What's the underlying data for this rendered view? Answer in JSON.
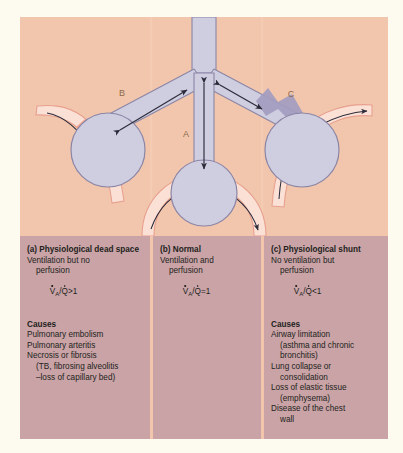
{
  "figure": {
    "kind": "medical-diagram",
    "title_visible": false,
    "colors": {
      "page": "#ffffff",
      "plate_border": "#fdfaf0",
      "plate_background": "#f2c6ac",
      "text_band": "#c9a3a6",
      "airway_fill": "#cfcde0",
      "airway_stroke": "#8b86a6",
      "alveolus_fill": "#cfcde0",
      "alveolus_stroke": "#8b86a6",
      "capillary_open": "#fbe0d6",
      "capillary_stroke": "#e8a08e",
      "capillary_blocked": "#ef9f8c",
      "airway_obstruction": "#a39cc0",
      "arrow": "#2b2b3a",
      "label_letter": "#8a6a4a",
      "text": "#231f20"
    }
  },
  "diagram_labels": {
    "a": "A",
    "b": "B",
    "c": "C"
  },
  "panels": [
    {
      "id": "a",
      "heading": "(a) Physiological dead space",
      "description": [
        "Ventilation but no",
        "perfusion"
      ],
      "ratio": {
        "num": "V",
        "num_sub": "A",
        "den": "Q",
        "op": ">1"
      },
      "causes_heading": "Causes",
      "causes": [
        {
          "text": "Pulmonary embolism",
          "indent": 0
        },
        {
          "text": "Pulmonary arteritis",
          "indent": 0
        },
        {
          "text": "Necrosis or fibrosis",
          "indent": 0
        },
        {
          "text": "(TB, fibrosing alveolitis",
          "indent": 1
        },
        {
          "text": "–loss of capillary bed)",
          "indent": 1
        }
      ]
    },
    {
      "id": "b",
      "heading": "(b) Normal",
      "description": [
        "Ventilation and",
        "perfusion"
      ],
      "ratio": {
        "num": "V",
        "num_sub": "A",
        "den": "Q",
        "op": "=1"
      },
      "causes_heading": "",
      "causes": []
    },
    {
      "id": "c",
      "heading": "(c) Physiological shunt",
      "description": [
        "No ventilation but",
        "perfusion"
      ],
      "ratio": {
        "num": "V",
        "num_sub": "A",
        "den": "Q",
        "op": "<1"
      },
      "causes_heading": "Causes",
      "causes": [
        {
          "text": "Airway limitation",
          "indent": 0
        },
        {
          "text": "(asthma and chronic",
          "indent": 1
        },
        {
          "text": "bronchitis)",
          "indent": 1
        },
        {
          "text": "Lung collapse or",
          "indent": 0
        },
        {
          "text": "consolidation",
          "indent": 1
        },
        {
          "text": "Loss of elastic tissue",
          "indent": 0
        },
        {
          "text": "(emphysema)",
          "indent": 1
        },
        {
          "text": "Disease of the chest",
          "indent": 0
        },
        {
          "text": "wall",
          "indent": 1
        }
      ]
    }
  ]
}
